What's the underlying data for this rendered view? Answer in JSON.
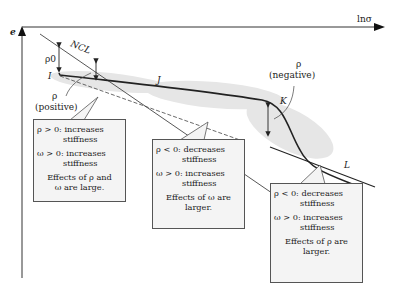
{
  "axes": {
    "x_label": "lnσ",
    "y_label": "e"
  },
  "curve_labels": {
    "ncl": "NCL",
    "rho0": "ρ0",
    "I": "I",
    "J": "J",
    "K": "K",
    "L": "L",
    "rho_pos_1": "ρ",
    "rho_pos_2": "(positive)",
    "rho_neg_1": "ρ",
    "rho_neg_2": "(negative)"
  },
  "boxes": [
    {
      "lines": [
        "ρ > 0: increases",
        "stiffness",
        "ω > 0: increases",
        "stiffness",
        "Effects of ρ and",
        "ω are large."
      ]
    },
    {
      "lines": [
        "ρ < 0: decreases",
        "stiffness",
        "ω > 0: increases",
        "stiffness",
        "Effects of ω are",
        "larger."
      ]
    },
    {
      "lines": [
        "ρ < 0: decreases",
        "stiffness",
        "ω > 0: increases",
        "stiffness",
        "Effects of ρ are",
        "larger."
      ]
    }
  ]
}
